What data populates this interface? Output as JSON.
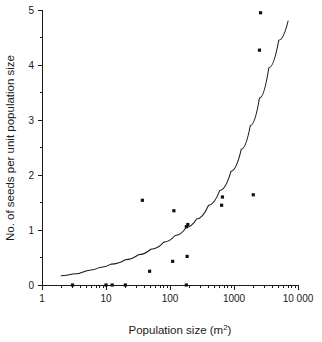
{
  "chart_data": {
    "type": "scatter",
    "title": "",
    "xlabel": "Population size (m2)",
    "xlabel_base": "Population size (m",
    "xlabel_sup": "2",
    "xlabel_close": ")",
    "ylabel": "No. of seeds per unit population size",
    "xscale": "log",
    "yscale": "linear",
    "xlim": [
      1,
      10000
    ],
    "ylim": [
      0,
      5
    ],
    "grid": false,
    "legend": false,
    "xticks": [
      1,
      10,
      100,
      1000,
      10000
    ],
    "xtick_labels": [
      "1",
      "10",
      "100",
      "1000",
      "10 000"
    ],
    "yticks": [
      0,
      1,
      2,
      3,
      4,
      5
    ],
    "ytick_labels": [
      "0",
      "1",
      "2",
      "3",
      "4",
      "5"
    ],
    "yticks_minor": [
      0.5,
      1.5,
      2.5,
      3.5,
      4.5
    ],
    "point_color": "#111111",
    "line_color": "#1a1a1a",
    "axis_color": "#1a1a1a",
    "background": "#ffffff",
    "points": [
      {
        "x": 3.0,
        "y": 0.0
      },
      {
        "x": 10.0,
        "y": 0.0
      },
      {
        "x": 12.5,
        "y": 0.0
      },
      {
        "x": 20.0,
        "y": 0.0
      },
      {
        "x": 180.0,
        "y": 0.0
      },
      {
        "x": 48.0,
        "y": 0.25
      },
      {
        "x": 110.0,
        "y": 0.43
      },
      {
        "x": 185.0,
        "y": 0.52
      },
      {
        "x": 180.0,
        "y": 1.06
      },
      {
        "x": 190.0,
        "y": 1.1
      },
      {
        "x": 115.0,
        "y": 1.35
      },
      {
        "x": 37.0,
        "y": 1.54
      },
      {
        "x": 640.0,
        "y": 1.45
      },
      {
        "x": 660.0,
        "y": 1.6
      },
      {
        "x": 2000.0,
        "y": 1.64
      },
      {
        "x": 2500.0,
        "y": 4.27
      },
      {
        "x": 2600.0,
        "y": 4.95
      }
    ],
    "fit_curve": {
      "description": "exponential-like increasing fit line",
      "x_start": 2.0,
      "x_end": 7000.0,
      "y_start": 0.17,
      "y_end": 4.8,
      "points": [
        {
          "x": 2.0,
          "y": 0.17
        },
        {
          "x": 3.0,
          "y": 0.2
        },
        {
          "x": 5.0,
          "y": 0.26
        },
        {
          "x": 8.0,
          "y": 0.32
        },
        {
          "x": 12.0,
          "y": 0.38
        },
        {
          "x": 20.0,
          "y": 0.46
        },
        {
          "x": 32.0,
          "y": 0.55
        },
        {
          "x": 50.0,
          "y": 0.65
        },
        {
          "x": 80.0,
          "y": 0.78
        },
        {
          "x": 120.0,
          "y": 0.9
        },
        {
          "x": 180.0,
          "y": 1.05
        },
        {
          "x": 260.0,
          "y": 1.2
        },
        {
          "x": 400.0,
          "y": 1.45
        },
        {
          "x": 600.0,
          "y": 1.72
        },
        {
          "x": 900.0,
          "y": 2.07
        },
        {
          "x": 1300.0,
          "y": 2.47
        },
        {
          "x": 1800.0,
          "y": 2.9
        },
        {
          "x": 2500.0,
          "y": 3.4
        },
        {
          "x": 3500.0,
          "y": 3.95
        },
        {
          "x": 5000.0,
          "y": 4.45
        },
        {
          "x": 7000.0,
          "y": 4.8
        }
      ]
    }
  }
}
